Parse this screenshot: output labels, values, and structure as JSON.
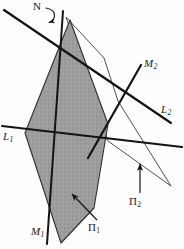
{
  "figure": {
    "background_color": "#fdfdfd",
    "plane1_fill": "#9a9a9a",
    "plane1_stroke": "#2b2b2b",
    "plane2_stroke": "#3a3a3a",
    "line_color": "#151515"
  },
  "labels": {
    "normal": {
      "text": "N",
      "sub": ""
    },
    "line_m2": {
      "text": "M",
      "sub": "2"
    },
    "line_l2": {
      "text": "L",
      "sub": "2"
    },
    "line_l1": {
      "text": "L",
      "sub": "1"
    },
    "line_m1": {
      "text": "M",
      "sub": "1"
    },
    "plane_1": {
      "text": "Π",
      "sub": "1"
    },
    "plane_2": {
      "text": "Π",
      "sub": "2"
    }
  },
  "geometry": {
    "plane1_polygon": "70,20 108,124 94,208 61,243 25,133",
    "plane2_polygon": "66,17 104,58 118,101 171,186 108,141",
    "line_L1": {
      "x1": 2,
      "y1": 126,
      "x2": 182,
      "y2": 147
    },
    "line_L2": {
      "x1": 4,
      "y1": 10,
      "x2": 171,
      "y2": 123
    },
    "line_M1": {
      "x1": 63,
      "y1": 11,
      "x2": 47,
      "y2": 244
    },
    "line_M2": {
      "x1": 88,
      "y1": 158,
      "x2": 141,
      "y2": 65
    },
    "arrow_plane1": {
      "x1": 96,
      "y1": 219,
      "x2": 73,
      "y2": 195
    },
    "arrow_plane2": {
      "x1": 140,
      "y1": 192,
      "x2": 140,
      "y2": 166
    },
    "normal_hook": "M 45,9 q 8,1 8,7 q 0,5 -5,6"
  }
}
